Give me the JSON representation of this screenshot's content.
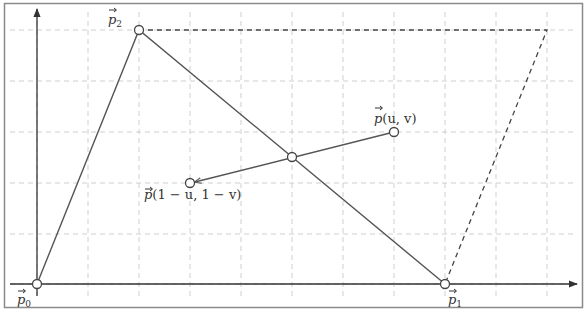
{
  "figure": {
    "colors": {
      "frame": "#8a8a8a",
      "grid": "#cfcfcf",
      "axis": "#333333",
      "line": "#555555",
      "dashed": "#444444",
      "point_fill": "#ffffff"
    },
    "grid": {
      "x_lines": [
        37,
        88,
        139,
        190,
        241,
        292,
        343,
        394,
        445,
        496,
        547
      ],
      "y_lines": [
        30,
        81,
        132,
        183,
        234,
        284
      ]
    },
    "axes": {
      "origin": [
        37,
        284
      ],
      "x_end": 577,
      "y_end": 8
    },
    "points": {
      "p0": {
        "label_base": "p",
        "label_sub": "0",
        "x": 37,
        "y": 284
      },
      "p1": {
        "label_base": "p",
        "label_sub": "1",
        "x": 445,
        "y": 284
      },
      "p2": {
        "label_base": "p",
        "label_sub": "2",
        "x": 139,
        "y": 30
      },
      "p_uv": {
        "label_base": "p",
        "label_args": "(u, v)",
        "x": 394,
        "y": 132
      },
      "p_sym": {
        "label_base": "p",
        "label_args": "(1 − u, 1 − v)",
        "x": 190,
        "y": 183
      },
      "center": {
        "x": 292,
        "y": 157
      },
      "p3_virtual": {
        "x": 547,
        "y": 30
      }
    },
    "labels": {
      "p0": "p⃗₀",
      "p1": "p⃗₁",
      "p2": "p⃗₂",
      "p_uv_base": "p",
      "p_uv_args": "(u, v)",
      "p_sym_base": "p",
      "p_sym_args": "(1 − u, 1 − v)",
      "sub0": "0",
      "sub1": "1",
      "sub2": "2"
    }
  }
}
